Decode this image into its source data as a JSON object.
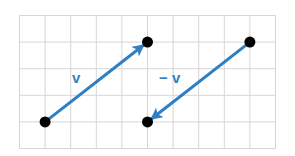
{
  "diagram": {
    "title": "",
    "grid": {
      "columns": 10,
      "rows": 5
    },
    "colors": {
      "vector": "#2f7fc4",
      "point": "#000000",
      "grid": "#d6d6d6"
    },
    "points": [
      {
        "id": "p1",
        "col": 1,
        "row": 4
      },
      {
        "id": "p2",
        "col": 5,
        "row": 1
      },
      {
        "id": "p3",
        "col": 9,
        "row": 1
      },
      {
        "id": "p4",
        "col": 5,
        "row": 4
      }
    ],
    "vectors": [
      {
        "id": "v",
        "label": "v",
        "from": "p1",
        "to": "p2"
      },
      {
        "id": "neg-v",
        "label": "− v",
        "from": "p3",
        "to": "p4"
      }
    ]
  }
}
